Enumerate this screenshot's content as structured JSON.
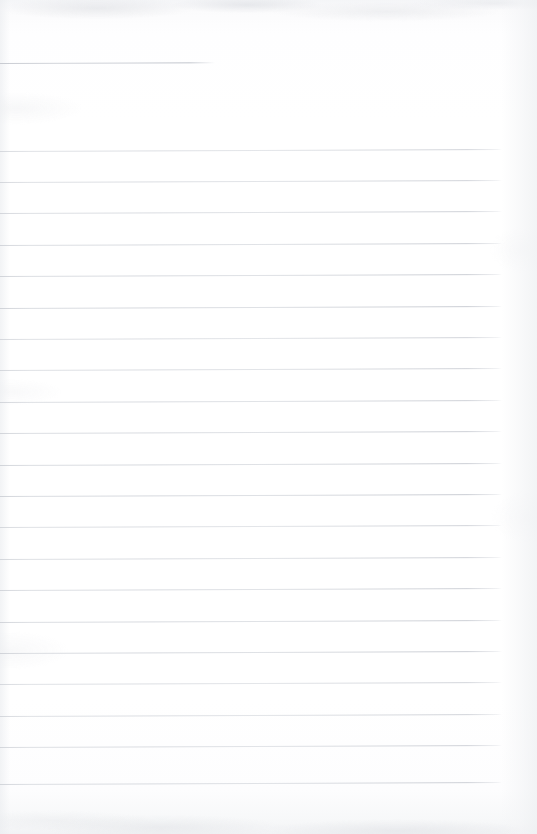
{
  "document": {
    "kind": "scanned-lined-paper",
    "title": "Blank ruled notebook page",
    "orientation": "portrait",
    "width_px": 537,
    "height_px": 834,
    "text_content": "",
    "handwriting_present": "no",
    "printed_text_present": "no"
  },
  "colors": {
    "paper": "#fefeff",
    "paper_tint_top": "#f4f5f7",
    "paper_tint_bottom": "#f2f3f5",
    "rule_line": "#d0d3d9",
    "rule_line_dark": "#c6c9d0",
    "scan_noise": "#c8cbd1"
  },
  "ruling": {
    "style": "wide-ruled horizontal lines",
    "line_count_full_width": 21,
    "line_spacing_px": 31.4,
    "first_full_line_y": 150.5,
    "last_full_line_y": 784.0,
    "line_left_x": 0,
    "line_right_x": 502,
    "line_thickness_px": 1,
    "skew_deg": -0.22,
    "header_rule": {
      "label": "short header rule",
      "y": 63,
      "x_start": 0,
      "x_end": 215
    },
    "lines_y": [
      150.5,
      181.9,
      213.3,
      244.7,
      276.1,
      307.5,
      338.9,
      370.3,
      401.7,
      433.1,
      464.5,
      495.9,
      527.3,
      558.7,
      590.1,
      621.5,
      652.9,
      684.3,
      715.7,
      747.1,
      784.0
    ]
  },
  "margins": {
    "top_blank_px": 150,
    "bottom_blank_px": 50,
    "right_blank_px": 35
  }
}
